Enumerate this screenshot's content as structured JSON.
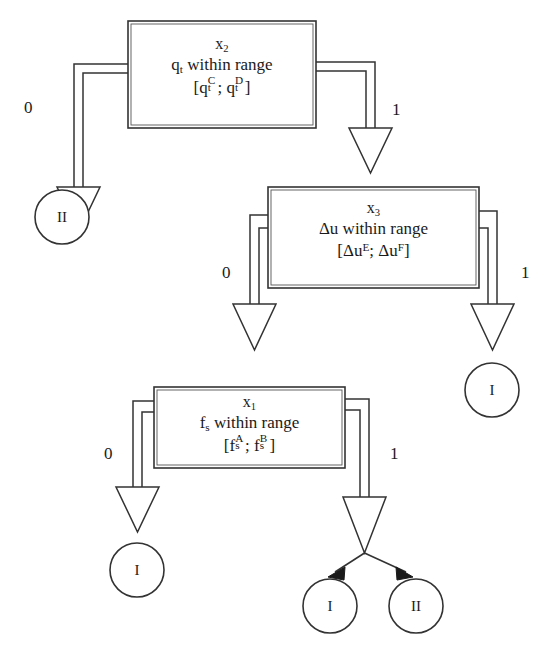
{
  "diagram": {
    "type": "decision-tree",
    "title": "",
    "stroke_color": "#333333",
    "fill_color": "#ffffff",
    "background": "#ffffff",
    "nodes": [
      {
        "id": "x2",
        "var_label": "x",
        "var_index": "2",
        "condition": "q_t within range",
        "condition_prefix": "q",
        "condition_prefix_sub": "t",
        "condition_text": " within range",
        "range_open": "[",
        "range_left_base": "q",
        "range_left_sub": "t",
        "range_left_sup": "C",
        "range_sep": "; ",
        "range_right_base": "q",
        "range_right_sub": "t",
        "range_right_sup": "D",
        "range_close": "]",
        "branch_labels": [
          "0",
          "1"
        ]
      },
      {
        "id": "x3",
        "var_label": "x",
        "var_index": "3",
        "condition": "Δu within range",
        "condition_prefix": "Δu",
        "condition_prefix_sub": "",
        "condition_text": " within range",
        "range_open": "[",
        "range_left_base": "Δu",
        "range_left_sub": "",
        "range_left_sup": "E",
        "range_sep": "; ",
        "range_right_base": "Δu",
        "range_right_sub": "",
        "range_right_sup": "F",
        "range_close": "]",
        "branch_labels": [
          "0",
          "1"
        ]
      },
      {
        "id": "x1",
        "var_label": "x",
        "var_index": "1",
        "condition": "f_s within range",
        "condition_prefix": "f",
        "condition_prefix_sub": "s",
        "condition_text": " within range",
        "range_open": "[",
        "range_left_base": "f",
        "range_left_sub": "s",
        "range_left_sup": "A",
        "range_sep": "; ",
        "range_right_base": "f",
        "range_right_sub": "s",
        "range_right_sup": "B",
        "range_close": "]",
        "branch_labels": [
          "0",
          "1"
        ]
      }
    ],
    "leaves": [
      {
        "id": "leaf-x2-0",
        "label": "II"
      },
      {
        "id": "leaf-x3-1",
        "label": "I"
      },
      {
        "id": "leaf-x1-0",
        "label": "I"
      },
      {
        "id": "leaf-x1-1a",
        "label": "I"
      },
      {
        "id": "leaf-x1-1b",
        "label": "II"
      }
    ],
    "edges": [
      {
        "from": "x2",
        "to": "leaf-x2-0",
        "label": "0",
        "style": "block-arrow"
      },
      {
        "from": "x2",
        "to": "x3",
        "label": "1",
        "style": "block-arrow"
      },
      {
        "from": "x3",
        "to": "x1",
        "label": "0",
        "style": "block-arrow"
      },
      {
        "from": "x3",
        "to": "leaf-x3-1",
        "label": "1",
        "style": "block-arrow"
      },
      {
        "from": "x1",
        "to": "leaf-x1-0",
        "label": "0",
        "style": "block-arrow"
      },
      {
        "from": "x1",
        "to": "split",
        "label": "1",
        "style": "block-arrow"
      },
      {
        "from": "split",
        "to": "leaf-x1-1a",
        "label": "",
        "style": "line-arrow"
      },
      {
        "from": "split",
        "to": "leaf-x1-1b",
        "label": "",
        "style": "line-arrow"
      }
    ]
  }
}
